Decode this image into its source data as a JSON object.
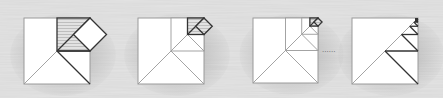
{
  "figure": {
    "panels": [
      {
        "id": 1,
        "x": 24,
        "y": 18,
        "size": 66,
        "depth": 1
      },
      {
        "id": 2,
        "x": 138,
        "y": 18,
        "size": 66,
        "depth": 2
      },
      {
        "id": 3,
        "x": 253,
        "y": 18,
        "size": 65,
        "depth": 3
      },
      {
        "id": 4,
        "x": 352,
        "y": 18,
        "size": 66,
        "depth": 6
      }
    ],
    "ellipsis": "......",
    "colors": {
      "background": "#e6e6e6",
      "square_fill": "#ffffff",
      "line_dark": "#333333",
      "line_light": "#9a9a9a",
      "hatch": "#cfcfcf"
    }
  }
}
